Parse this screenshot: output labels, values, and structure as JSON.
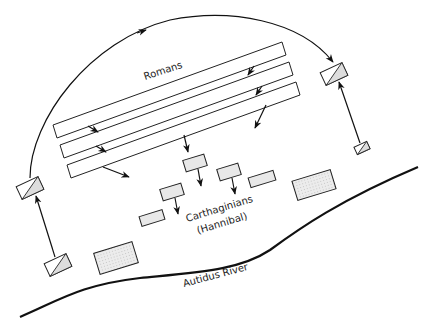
{
  "diagram": {
    "labels": {
      "romans": "Romans",
      "carthaginians": "Carthaginians",
      "hannibal": "(Hannibal)",
      "river": "Autidus River"
    },
    "colors": {
      "stroke": "#222222",
      "unit_fill": "#e8e8e8",
      "background": "#ffffff"
    },
    "roman_lines": 3,
    "carthaginian_infantry_units": 7,
    "cavalry_units": 4
  }
}
